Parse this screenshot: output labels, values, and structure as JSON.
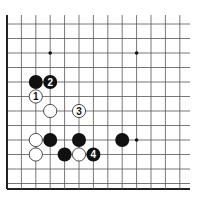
{
  "diagram": {
    "type": "go-board-fragment",
    "grid": {
      "columns_x": [
        7,
        21.4,
        35.8,
        50.2,
        64.6,
        79,
        93.4,
        107.8,
        122.2,
        136.6,
        151,
        165.4,
        179.8
      ],
      "rows_y": [
        15,
        24,
        38.5,
        53,
        67.5,
        82,
        96.5,
        111,
        125.5,
        140,
        146,
        160.5,
        175,
        189
      ],
      "line_color": "#555555",
      "edge_color": "#222222"
    },
    "star_points": [
      {
        "col": 3,
        "row": 3
      },
      {
        "col": 9,
        "row": 3
      },
      {
        "col": 9,
        "row": 9
      }
    ],
    "stones": [
      {
        "color": "black",
        "col": 2,
        "row": 5,
        "label": ""
      },
      {
        "color": "black",
        "col": 3,
        "row": 5,
        "label": "2"
      },
      {
        "color": "white",
        "col": 2,
        "row": 6,
        "label": "1"
      },
      {
        "color": "white",
        "col": 3,
        "row": 7,
        "label": ""
      },
      {
        "color": "white",
        "col": 5,
        "row": 7,
        "label": "3"
      },
      {
        "color": "white",
        "col": 2,
        "row": 9,
        "label": ""
      },
      {
        "color": "black",
        "col": 3,
        "row": 9,
        "label": ""
      },
      {
        "color": "black",
        "col": 5,
        "row": 9,
        "label": ""
      },
      {
        "color": "black",
        "col": 8,
        "row": 9,
        "label": ""
      },
      {
        "color": "white",
        "col": 2,
        "row": 10,
        "label": ""
      },
      {
        "color": "black",
        "col": 4,
        "row": 10,
        "label": ""
      },
      {
        "color": "white",
        "col": 5,
        "row": 10,
        "label": ""
      },
      {
        "color": "black",
        "col": 6,
        "row": 10,
        "label": "4"
      }
    ]
  }
}
